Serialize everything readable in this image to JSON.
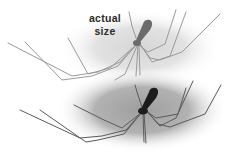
{
  "image": {
    "description": "Illustration of a long-legged cellar spider shown twice: a pale version labeled actual size on a light vignette, and a darker detailed version on a grey vignette below.",
    "label": {
      "line1": "actual",
      "line2": "size"
    },
    "colors": {
      "background": "#ffffff",
      "top_vignette": "#dedede",
      "bottom_vignette": "#a9a9a9",
      "top_spider_body": "#6b6b6b",
      "top_spider_legs": "#9a9a9a",
      "bottom_spider_body": "#1c1c1c",
      "bottom_spider_legs": "#5a5a5a",
      "label_text": "#2a2a2a"
    }
  }
}
